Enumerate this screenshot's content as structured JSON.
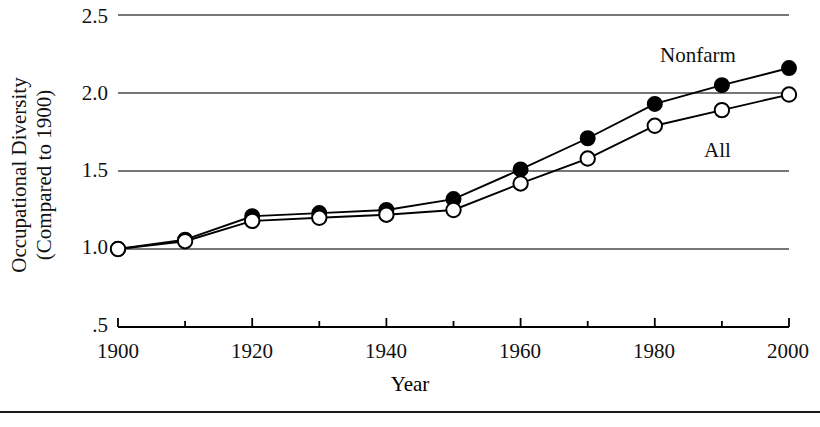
{
  "chart_data": {
    "type": "line",
    "title": "",
    "xlabel": "Year",
    "ylabel": "Occupational Diversity (Compared to 1900)",
    "ylabel_line1": "Occupational Diversity",
    "ylabel_line2": "(Compared to 1900)",
    "x": [
      1900,
      1910,
      1920,
      1930,
      1940,
      1950,
      1960,
      1970,
      1980,
      1990,
      2000
    ],
    "xlim": [
      1900,
      2000
    ],
    "ylim": [
      0.5,
      2.5
    ],
    "xticks_major": [
      1900,
      1920,
      1940,
      1960,
      1980,
      2000
    ],
    "xtick_labels": [
      "1900",
      "1920",
      "1940",
      "1960",
      "1980",
      "2000"
    ],
    "xticks_minor": [
      1910,
      1930,
      1950,
      1970,
      1990
    ],
    "yticks": [
      0.5,
      1.0,
      1.5,
      2.0,
      2.5
    ],
    "ytick_labels": [
      ".5",
      "1.0",
      "1.5",
      "2.0",
      "2.5"
    ],
    "gridlines_at": [
      1.0,
      1.5,
      2.0,
      2.5
    ],
    "grid": true,
    "legend_position": "inline-annotations",
    "series": [
      {
        "name": "Nonfarm",
        "marker": "filled-circle",
        "color": "#000000",
        "values": [
          1.0,
          1.06,
          1.21,
          1.23,
          1.25,
          1.32,
          1.51,
          1.71,
          1.93,
          2.05,
          2.16
        ]
      },
      {
        "name": "All",
        "marker": "open-circle",
        "color": "#000000",
        "values": [
          1.0,
          1.05,
          1.18,
          1.2,
          1.22,
          1.25,
          1.42,
          1.58,
          1.79,
          1.89,
          1.99
        ]
      }
    ],
    "annotations": [
      {
        "text": "Nonfarm",
        "x_px": 660,
        "y_px": 43
      },
      {
        "text": "All",
        "x_px": 704,
        "y_px": 138
      }
    ]
  },
  "axis": {
    "ytick_0": ".5",
    "ytick_1": "1.0",
    "ytick_2": "1.5",
    "ytick_3": "2.0",
    "ytick_4": "2.5",
    "xtick_0": "1900",
    "xtick_1": "1920",
    "xtick_2": "1940",
    "xtick_3": "1960",
    "xtick_4": "1980",
    "xtick_5": "2000"
  },
  "labels": {
    "series_nonfarm": "Nonfarm",
    "series_all": "All",
    "x_axis_title": "Year",
    "y_axis_title_line1": "Occupational Diversity",
    "y_axis_title_line2": "(Compared to 1900)"
  },
  "colors": {
    "ink": "#000000",
    "grid": "#4a4a4a",
    "rule": "#1a1a1a"
  }
}
